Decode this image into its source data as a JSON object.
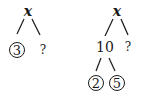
{
  "trees": [
    {
      "root": "x",
      "left": {
        "value": "3",
        "circled": true
      },
      "right": {
        "value": "?",
        "circled": false
      }
    },
    {
      "root": "x",
      "left": {
        "value": "10",
        "circled": false,
        "left": {
          "value": "2",
          "circled": true
        },
        "right": {
          "value": "5",
          "circled": true
        }
      },
      "right": {
        "value": "?",
        "circled": false
      }
    }
  ]
}
